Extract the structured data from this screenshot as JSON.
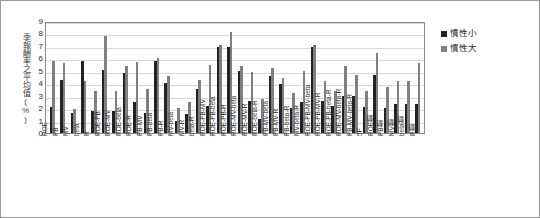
{
  "chart_data": {
    "type": "bar",
    "title": "",
    "xlabel": "",
    "ylabel": "季報酬率之平均值(%)",
    "ylim": [
      0,
      9
    ],
    "ytick_labels": [
      "0",
      "1",
      "2",
      "3",
      "4",
      "5",
      "6",
      "7",
      "8",
      "9"
    ],
    "grid": true,
    "legend_position": "right",
    "categories": [
      "ROE",
      "PB",
      "MV",
      "beta",
      "R",
      "ROE-PB",
      "ROE-MV",
      "ROE-beta",
      "ROE-R",
      "PB-MV",
      "PB-beta",
      "PB-R",
      "MV-beta",
      "MV-R",
      "beta-R",
      "ROE-PB-MV",
      "ROE-PB-beta",
      "ROE-PB-R",
      "ROE-MV-beta",
      "ROE-MV-R",
      "ROE-beta-R",
      "PB-MV-beta",
      "PB-MV-R",
      "PB-beta-R",
      "MV-beta-R",
      "ROE-PB-MV-beta",
      "ROE-PB-MV-R",
      "ROE-PB-beta-R",
      "ROE-MV-beta-R",
      "PB-MV-beta-R",
      "5F",
      "ROE動",
      "PB動",
      "MV動",
      "beta動",
      "R動"
    ],
    "series": [
      {
        "name": "慣性小",
        "color": "#222222",
        "values": [
          2.1,
          4.3,
          1.6,
          5.8,
          1.8,
          5.1,
          1.8,
          4.8,
          2.5,
          1.6,
          5.8,
          4.0,
          1.0,
          1.5,
          3.5,
          2.2,
          6.9,
          6.9,
          5.0,
          2.6,
          1.1,
          4.6,
          3.9,
          2.0,
          2.5,
          6.9,
          2.6,
          2.2,
          3.0,
          3.0,
          2.1,
          4.7,
          2.0,
          2.3,
          2.3,
          2.3
        ]
      },
      {
        "name": "慣性大",
        "color": "#808080",
        "values": [
          5.8,
          5.6,
          1.9,
          4.2,
          3.4,
          7.8,
          3.4,
          5.4,
          5.7,
          3.5,
          6.0,
          4.6,
          2.0,
          2.5,
          4.3,
          5.5,
          7.1,
          8.1,
          5.4,
          4.9,
          2.7,
          5.2,
          4.4,
          3.2,
          5.0,
          7.1,
          4.2,
          3.4,
          5.4,
          4.7,
          3.4,
          6.4,
          3.7,
          4.2,
          4.2,
          5.6
        ]
      }
    ]
  },
  "legend": {
    "items": [
      {
        "label": "慣性小"
      },
      {
        "label": "慣性大"
      }
    ]
  }
}
